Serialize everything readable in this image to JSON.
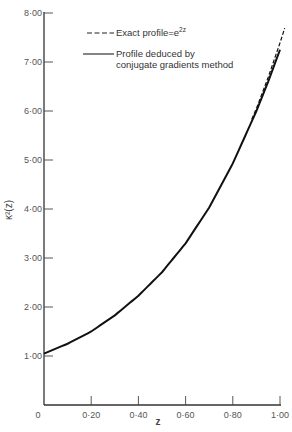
{
  "chart_data": {
    "type": "line",
    "title": "",
    "xlabel": "z",
    "ylabel": "κ²(z)",
    "xlim": [
      0,
      1.0
    ],
    "ylim": [
      0,
      8.0
    ],
    "grid": false,
    "legend_position": "upper-left-inside",
    "x_ticks": [
      0,
      0.2,
      0.4,
      0.6,
      0.8,
      1.0
    ],
    "x_tick_labels": [
      "0",
      "0·20",
      "0·40",
      "0·60",
      "0·80",
      "1·00"
    ],
    "y_ticks": [
      1,
      2,
      3,
      4,
      5,
      6,
      7,
      8
    ],
    "y_tick_labels": [
      "1·00",
      "2·00",
      "3·00",
      "4·00",
      "5·00",
      "6·00",
      "7·00",
      "8·00"
    ],
    "x": [
      0,
      0.1,
      0.2,
      0.3,
      0.4,
      0.5,
      0.6,
      0.7,
      0.8,
      0.9,
      0.95,
      1.0,
      1.02
    ],
    "series": [
      {
        "name": "Exact profile=e^2z",
        "style": "dashed",
        "values": [
          1.0,
          1.22,
          1.49,
          1.82,
          2.23,
          2.72,
          3.32,
          4.06,
          4.95,
          6.05,
          6.69,
          7.39,
          7.69
        ]
      },
      {
        "name": "Profile deduced by conjugate gradients method",
        "style": "solid",
        "values": [
          1.05,
          1.25,
          1.5,
          1.83,
          2.23,
          2.71,
          3.3,
          4.03,
          4.93,
          6.0,
          6.6,
          7.25,
          7.5
        ]
      }
    ]
  },
  "legend": {
    "exact_label": "Exact profile=e",
    "exact_sup": "2z",
    "deduced_line1": "Profile deduced by",
    "deduced_line2": "conjugate gradients method"
  },
  "axes": {
    "xlabel": "z",
    "ylabel": "κ²(z)"
  }
}
